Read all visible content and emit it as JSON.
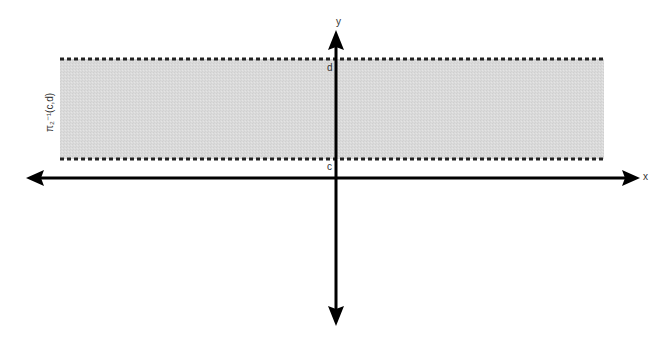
{
  "diagram": {
    "type": "preimage-strip",
    "axes": {
      "x_label": "x",
      "y_label": "y"
    },
    "strip": {
      "label": "π₂⁻¹(c,d)",
      "lower_bound_label": "c",
      "upper_bound_label": "d",
      "fill_color": "#d9d9d9",
      "border_style": "dotted"
    },
    "colors": {
      "axis": "#000000",
      "background": "#ffffff"
    }
  }
}
